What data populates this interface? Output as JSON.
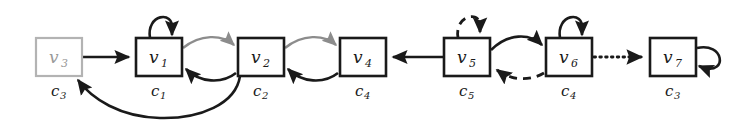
{
  "figure": {
    "kind": "directed-graph-diagram",
    "width": 743,
    "height": 121,
    "background": "#ffffff"
  },
  "palette": {
    "ink": "#1a1a1a",
    "muted_gray": "#9a9a9a",
    "edge_gray": "#8c8c8c",
    "box_fill": "#ffffff"
  },
  "nodes": [
    {
      "id": "v3",
      "base": "v",
      "sub": "3",
      "color_base": "c",
      "color_sub": "3",
      "style": "muted",
      "x": 36,
      "y": 38,
      "w": 46,
      "h": 38
    },
    {
      "id": "v1",
      "base": "v",
      "sub": "1",
      "color_base": "c",
      "color_sub": "1",
      "style": "normal",
      "x": 136,
      "y": 38,
      "w": 46,
      "h": 38
    },
    {
      "id": "v2",
      "base": "v",
      "sub": "2",
      "color_base": "c",
      "color_sub": "2",
      "style": "normal",
      "x": 238,
      "y": 38,
      "w": 46,
      "h": 38
    },
    {
      "id": "v4",
      "base": "v",
      "sub": "4",
      "color_base": "c",
      "color_sub": "4",
      "style": "normal",
      "x": 340,
      "y": 38,
      "w": 46,
      "h": 38
    },
    {
      "id": "v5",
      "base": "v",
      "sub": "5",
      "color_base": "c",
      "color_sub": "5",
      "style": "normal",
      "x": 444,
      "y": 38,
      "w": 46,
      "h": 38
    },
    {
      "id": "v6",
      "base": "v",
      "sub": "6",
      "color_base": "c",
      "color_sub": "4",
      "style": "normal",
      "x": 546,
      "y": 38,
      "w": 46,
      "h": 38
    },
    {
      "id": "v7",
      "base": "v",
      "sub": "7",
      "color_base": "c",
      "color_sub": "3",
      "style": "normal",
      "x": 650,
      "y": 38,
      "w": 46,
      "h": 38
    }
  ],
  "edges": [
    {
      "name": "edge-v3-to-v1",
      "from": "v3",
      "to": "v1",
      "style": "solid",
      "tone": "black",
      "shape": "straight"
    },
    {
      "name": "self-loop-v1",
      "from": "v1",
      "to": "v1",
      "style": "solid",
      "tone": "black",
      "shape": "loop-top"
    },
    {
      "name": "edge-v1-to-v2",
      "from": "v1",
      "to": "v2",
      "style": "solid",
      "tone": "gray",
      "shape": "curve-upper"
    },
    {
      "name": "edge-v2-to-v1",
      "from": "v2",
      "to": "v1",
      "style": "solid",
      "tone": "black",
      "shape": "curve-lower"
    },
    {
      "name": "edge-v2-to-v4",
      "from": "v2",
      "to": "v4",
      "style": "solid",
      "tone": "gray",
      "shape": "curve-upper"
    },
    {
      "name": "edge-v4-to-v2",
      "from": "v4",
      "to": "v2",
      "style": "solid",
      "tone": "black",
      "shape": "curve-lower"
    },
    {
      "name": "edge-v2-to-v3",
      "from": "v2",
      "to": "v3",
      "style": "solid",
      "tone": "black",
      "shape": "long-bottom-curve"
    },
    {
      "name": "edge-v5-to-v4",
      "from": "v5",
      "to": "v4",
      "style": "solid",
      "tone": "black",
      "shape": "straight"
    },
    {
      "name": "self-loop-v5",
      "from": "v5",
      "to": "v5",
      "style": "dashed",
      "tone": "black",
      "shape": "loop-top"
    },
    {
      "name": "edge-v5-to-v6",
      "from": "v5",
      "to": "v6",
      "style": "solid",
      "tone": "black",
      "shape": "curve-upper"
    },
    {
      "name": "edge-v6-to-v5",
      "from": "v6",
      "to": "v5",
      "style": "dashed",
      "tone": "black",
      "shape": "curve-lower"
    },
    {
      "name": "self-loop-v6",
      "from": "v6",
      "to": "v6",
      "style": "solid",
      "tone": "black",
      "shape": "loop-top"
    },
    {
      "name": "edge-v6-to-v7",
      "from": "v6",
      "to": "v7",
      "style": "dotted",
      "tone": "black",
      "shape": "straight"
    },
    {
      "name": "self-loop-v7",
      "from": "v7",
      "to": "v7",
      "style": "solid",
      "tone": "black",
      "shape": "loop-right"
    }
  ]
}
